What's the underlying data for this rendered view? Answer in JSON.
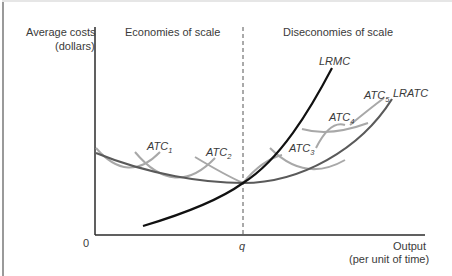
{
  "diagram": {
    "y_axis_label_line1": "Average costs",
    "y_axis_label_line2": "(dollars)",
    "x_axis_label_line1": "Output",
    "x_axis_label_line2": "(per unit of time)",
    "origin_label": "0",
    "q_label": "q",
    "region_left": "Economies of scale",
    "region_right": "Diseconomies of scale",
    "curves": {
      "lrmc": "LRMC",
      "lratc": "LRATC",
      "atc_base": "ATC",
      "atc1_sub": "1",
      "atc2_sub": "2",
      "atc3_sub": "3",
      "atc4_sub": "4",
      "atc5_sub": "5"
    },
    "colors": {
      "axis": "#2b2b2b",
      "lrmc": "#111111",
      "lratc": "#5a5a5a",
      "atc": "#a8a8a8",
      "dashed": "#555555",
      "text": "#3a3a3a"
    }
  }
}
